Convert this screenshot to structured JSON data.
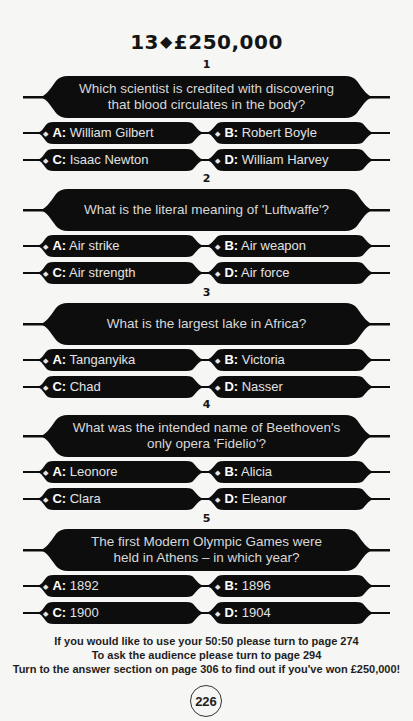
{
  "header": {
    "level": "13",
    "separator": "◆",
    "prize": "£250,000"
  },
  "questions": [
    {
      "number": "1",
      "lines": [
        "Which scientist is credited with discovering",
        "that blood circulates in the body?"
      ],
      "answers": [
        {
          "letter": "A:",
          "text": "William Gilbert"
        },
        {
          "letter": "B:",
          "text": "Robert Boyle"
        },
        {
          "letter": "C:",
          "text": "Isaac Newton"
        },
        {
          "letter": "D:",
          "text": "William Harvey"
        }
      ]
    },
    {
      "number": "2",
      "lines": [
        "What is the literal meaning of 'Luftwaffe'?",
        ""
      ],
      "answers": [
        {
          "letter": "A:",
          "text": "Air strike"
        },
        {
          "letter": "B:",
          "text": "Air weapon"
        },
        {
          "letter": "C:",
          "text": "Air strength"
        },
        {
          "letter": "D:",
          "text": "Air force"
        }
      ]
    },
    {
      "number": "3",
      "lines": [
        "What is the largest lake in Africa?",
        ""
      ],
      "answers": [
        {
          "letter": "A:",
          "text": "Tanganyika"
        },
        {
          "letter": "B:",
          "text": "Victoria"
        },
        {
          "letter": "C:",
          "text": "Chad"
        },
        {
          "letter": "D:",
          "text": "Nasser"
        }
      ]
    },
    {
      "number": "4",
      "lines": [
        "What was the intended name of Beethoven's",
        "only opera 'Fidelio'?"
      ],
      "answers": [
        {
          "letter": "A:",
          "text": "Leonore"
        },
        {
          "letter": "B:",
          "text": "Alicia"
        },
        {
          "letter": "C:",
          "text": "Clara"
        },
        {
          "letter": "D:",
          "text": "Eleanor"
        }
      ]
    },
    {
      "number": "5",
      "lines": [
        "The first Modern Olympic Games were",
        "held in Athens – in which year?"
      ],
      "answers": [
        {
          "letter": "A:",
          "text": "1892"
        },
        {
          "letter": "B:",
          "text": "1896"
        },
        {
          "letter": "C:",
          "text": "1900"
        },
        {
          "letter": "D:",
          "text": "1904"
        }
      ]
    }
  ],
  "footer": {
    "lifeline_5050": "If you would like to use your 50:50 please turn to page 274",
    "ask_audience": "To ask the audience please turn to page 294",
    "answer_section": "Turn to the answer section on page 306 to find out if you've won £250,000!",
    "page_number": "226"
  },
  "colors": {
    "banner": "#0d0d0d",
    "page_bg": "#f6f6f4",
    "question_text": "#d8d8d8",
    "answer_text": "#e2e2e2"
  }
}
